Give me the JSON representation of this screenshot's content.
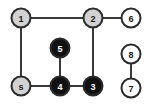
{
  "diagram": {
    "width": 151,
    "height": 105,
    "background_color": "#ffffff"
  },
  "palette": {
    "node_gray_fill": "#d2d2d2",
    "node_white_fill": "#fefefe",
    "node_black_fill": "#111111",
    "node_stroke": "#2b2b2b",
    "edge_stroke": "#3a3a3a",
    "label_dark": "#1a1a1a",
    "label_light": "#ffffff"
  },
  "nodes": [
    {
      "id": "1",
      "label": "1",
      "cx": 21,
      "cy": 18,
      "r": 9.5,
      "state": "gray",
      "fill": "#d2d2d2",
      "text_color": "#1a1a1a"
    },
    {
      "id": "2",
      "label": "2",
      "cx": 93,
      "cy": 18,
      "r": 9.5,
      "state": "gray",
      "fill": "#d2d2d2",
      "text_color": "#1a1a1a"
    },
    {
      "id": "6",
      "label": "6",
      "cx": 131,
      "cy": 18,
      "r": 9.5,
      "state": "white",
      "fill": "#fefefe",
      "text_color": "#1a1a1a"
    },
    {
      "id": "8",
      "label": "8",
      "cx": 131,
      "cy": 54,
      "r": 9.5,
      "state": "white",
      "fill": "#fefefe",
      "text_color": "#1a1a1a"
    },
    {
      "id": "7",
      "label": "7",
      "cx": 131,
      "cy": 88,
      "r": 9.5,
      "state": "white",
      "fill": "#fefefe",
      "text_color": "#1a1a1a"
    },
    {
      "id": "s",
      "label": "s",
      "cx": 21,
      "cy": 86,
      "r": 9.5,
      "state": "gray",
      "fill": "#d2d2d2",
      "text_color": "#1a1a1a"
    },
    {
      "id": "5",
      "label": "5",
      "cx": 60,
      "cy": 48,
      "r": 9.5,
      "state": "black",
      "fill": "#111111",
      "text_color": "#ffffff"
    },
    {
      "id": "4",
      "label": "4",
      "cx": 60,
      "cy": 86,
      "r": 9.5,
      "state": "black",
      "fill": "#111111",
      "text_color": "#ffffff"
    },
    {
      "id": "3",
      "label": "3",
      "cx": 93,
      "cy": 86,
      "r": 9.5,
      "state": "black",
      "fill": "#111111",
      "text_color": "#ffffff"
    }
  ],
  "edges": [
    {
      "id": "edge-1-2",
      "from": "1",
      "to": "2",
      "x1": 21,
      "y1": 18,
      "x2": 93,
      "y2": 18
    },
    {
      "id": "edge-2-6",
      "from": "2",
      "to": "6",
      "x1": 93,
      "y1": 18,
      "x2": 131,
      "y2": 18
    },
    {
      "id": "edge-1-s",
      "from": "1",
      "to": "s",
      "x1": 21,
      "y1": 18,
      "x2": 21,
      "y2": 86
    },
    {
      "id": "edge-2-3",
      "from": "2",
      "to": "3",
      "x1": 93,
      "y1": 18,
      "x2": 93,
      "y2": 86
    },
    {
      "id": "edge-s-4",
      "from": "s",
      "to": "4",
      "x1": 21,
      "y1": 86,
      "x2": 60,
      "y2": 86
    },
    {
      "id": "edge-4-3",
      "from": "4",
      "to": "3",
      "x1": 60,
      "y1": 86,
      "x2": 93,
      "y2": 86
    },
    {
      "id": "edge-5-4",
      "from": "5",
      "to": "4",
      "x1": 60,
      "y1": 48,
      "x2": 60,
      "y2": 86
    },
    {
      "id": "edge-8-7",
      "from": "8",
      "to": "7",
      "x1": 131,
      "y1": 54,
      "x2": 131,
      "y2": 88
    }
  ]
}
